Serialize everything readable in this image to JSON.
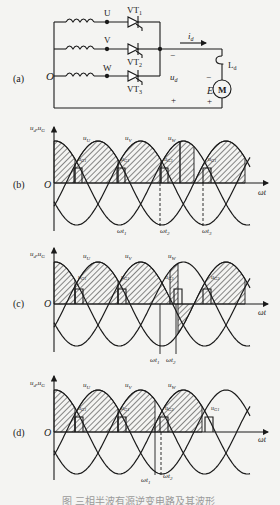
{
  "figure": {
    "panels": [
      {
        "id": "a",
        "label": "(a)",
        "type": "circuit",
        "title": "three-phase half-wave controlled rectifier / inverter circuit",
        "nodes": {
          "O": "O",
          "U": "U",
          "V": "V",
          "W": "W"
        },
        "thyristors": [
          "VT1",
          "VT2",
          "VT3"
        ],
        "thyristor_labels": [
          {
            "main": "VT",
            "sub": "1"
          },
          {
            "main": "VT",
            "sub": "2"
          },
          {
            "main": "VT",
            "sub": "3"
          }
        ],
        "current_label": {
          "main": "i",
          "sub": "d"
        },
        "voltage_label": {
          "main": "u",
          "sub": "d"
        },
        "inductor_label": {
          "main": "L",
          "sub": "d"
        },
        "emf_label": "E",
        "motor_label": "M",
        "polarity": {
          "left_top": "−",
          "left_bottom": "+",
          "right_top": "−",
          "right_bottom": "+"
        }
      },
      {
        "id": "b",
        "label": "(b)",
        "type": "waveform",
        "y_axis_label": "u_d,u_G",
        "x_axis_label": "ωt",
        "origin_label": "O",
        "phase_labels": [
          "u_U",
          "u_V",
          "u_W"
        ],
        "gate_pulse_labels": [
          "u_G1",
          "u_G1",
          "u_G3",
          "u_G1"
        ],
        "time_markers": [
          "ωt1",
          "ωt2",
          "ωt3"
        ]
      },
      {
        "id": "c",
        "label": "(c)",
        "type": "waveform",
        "y_axis_label": "u_d,u_G",
        "x_axis_label": "ωt",
        "origin_label": "O",
        "phase_labels": [
          "u_U",
          "u_V",
          "u_W"
        ],
        "gate_pulse_labels": [
          "u_G1",
          "u_G1",
          "u_G3",
          "u_G3"
        ],
        "time_markers": [
          "ωt1",
          "ωt2"
        ]
      },
      {
        "id": "d",
        "label": "(d)",
        "type": "waveform",
        "y_axis_label": "u_d,u_G",
        "x_axis_label": "ωt",
        "origin_label": "O",
        "phase_labels": [
          "u_U",
          "u_V",
          "u_W"
        ],
        "gate_pulse_labels": [
          "u_G1",
          "u_G1",
          "u_G3",
          "u_G1"
        ],
        "time_markers": [
          "ωt1",
          "ωt2"
        ]
      }
    ],
    "caption": "图 三相半波有源逆变电路及其波形"
  },
  "colors": {
    "background": "#f4f4f2",
    "ink": "#1a1a1a",
    "hatch": "#2a2a2a",
    "caption": "#9a9a9a"
  }
}
